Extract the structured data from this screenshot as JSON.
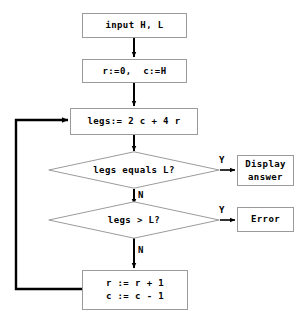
{
  "diagram": {
    "type": "flowchart",
    "title": "",
    "background_color": "#ffffff",
    "box_border_color": "#9b9b9b",
    "line_color": "#000000",
    "text_color": "#000000",
    "nodes": [
      {
        "id": "input",
        "shape": "rectangle",
        "text": "input H, L"
      },
      {
        "id": "init",
        "shape": "rectangle",
        "text": "r:=0,  c:=H"
      },
      {
        "id": "legs",
        "shape": "rectangle",
        "text": "legs:= 2 c + 4 r"
      },
      {
        "id": "equals",
        "shape": "diamond",
        "text": "legs equals L?"
      },
      {
        "id": "greater",
        "shape": "diamond",
        "text": "legs > L?"
      },
      {
        "id": "display",
        "shape": "rectangle",
        "line1": "Display",
        "line2": "answer"
      },
      {
        "id": "error",
        "shape": "rectangle",
        "text": "Error"
      },
      {
        "id": "update",
        "shape": "rectangle",
        "line1": "r := r + 1",
        "line2": "c := c - 1"
      }
    ],
    "edge_labels": {
      "equals_yes": "Y",
      "equals_no": "N",
      "greater_yes": "Y",
      "greater_no": "N"
    }
  }
}
